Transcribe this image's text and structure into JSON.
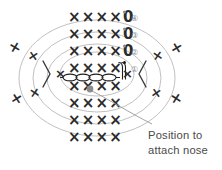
{
  "diagram": {
    "colors": {
      "stitch": "#2b2b2b",
      "oval_guide": "#b9b9b9",
      "row_number": "#8e8e8e",
      "callout_text": "#4a4a4a",
      "marker_dot": "#8c8c8c",
      "leader_line": "#9a9a9a",
      "background": "#ffffff"
    },
    "symbols": {
      "single_crochet": "X",
      "slip_or_ring": "0",
      "chevron_left": "chevron-right-mark",
      "chevron_right": "chevron-left-mark"
    },
    "rows": [
      {
        "id": "row-4",
        "number": "④",
        "stitches": "××××0",
        "has_dot": true,
        "x": 70,
        "y": 17
      },
      {
        "id": "row-3",
        "number": "③",
        "stitches": "××××0",
        "has_dot": true,
        "x": 70,
        "y": 34
      },
      {
        "id": "row-2",
        "number": "②",
        "stitches": "××××0",
        "has_dot": true,
        "x": 70,
        "y": 51
      },
      {
        "id": "row-1",
        "number": "①",
        "stitches": "××××",
        "has_dot": true,
        "x": 70,
        "y": 68
      },
      {
        "id": "row-c",
        "number": "",
        "stitches": "××××",
        "has_dot": false,
        "x": 70,
        "y": 86
      },
      {
        "id": "row-b",
        "number": "",
        "stitches": "××××",
        "has_dot": false,
        "x": 70,
        "y": 103
      },
      {
        "id": "row-a",
        "number": "",
        "stitches": "××××",
        "has_dot": false,
        "x": 70,
        "y": 120
      },
      {
        "id": "row-0",
        "number": "",
        "stitches": "××××",
        "has_dot": false,
        "x": 70,
        "y": 137
      }
    ],
    "row_numbers": [
      "④",
      "③",
      "②",
      "①"
    ],
    "outer_stitches": [
      {
        "id": "outer-l-1",
        "mark": "×",
        "x": 14,
        "y": 47,
        "rot": -14
      },
      {
        "id": "outer-l-2",
        "mark": "×",
        "x": 33,
        "y": 55,
        "rot": 10
      },
      {
        "id": "outer-l-3",
        "mark": "×",
        "x": 16,
        "y": 98,
        "rot": 12
      },
      {
        "id": "outer-l-4",
        "mark": "×",
        "x": 34,
        "y": 92,
        "rot": -10
      },
      {
        "id": "outer-l-5",
        "mark": "×",
        "x": 60,
        "y": 73,
        "rot": 0
      },
      {
        "id": "outer-r-1",
        "mark": "×",
        "x": 176,
        "y": 47,
        "rot": 14
      },
      {
        "id": "outer-r-2",
        "mark": "×",
        "x": 157,
        "y": 55,
        "rot": -10
      },
      {
        "id": "outer-r-3",
        "mark": "×",
        "x": 175,
        "y": 98,
        "rot": -12
      },
      {
        "id": "outer-r-4",
        "mark": "×",
        "x": 156,
        "y": 92,
        "rot": 10
      },
      {
        "id": "outer-r-5",
        "mark": "×",
        "x": 127,
        "y": 73,
        "rot": 0
      }
    ],
    "marker": {
      "label": "nose-position-marker",
      "x": 90,
      "y": 89,
      "radius": 3.4
    },
    "callout": {
      "line1": "Position to",
      "line2": "attach nose"
    }
  }
}
